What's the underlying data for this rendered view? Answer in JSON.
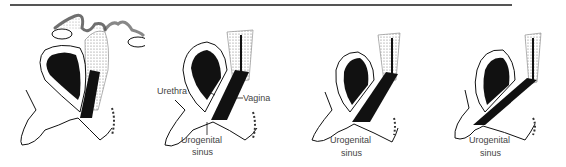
{
  "figure": {
    "panels": [
      {
        "id": "stage-1",
        "labels": {}
      },
      {
        "id": "stage-2",
        "labels": {
          "urethra": "Urethra",
          "vagina": "Vagina",
          "sinus_line1": "Urogenital",
          "sinus_line2": "sinus"
        }
      },
      {
        "id": "stage-3",
        "labels": {
          "sinus_line1": "Urogenital",
          "sinus_line2": "sinus"
        }
      },
      {
        "id": "stage-4",
        "labels": {
          "sinus_line1": "Urogenital",
          "sinus_line2": "sinus"
        }
      }
    ],
    "colors": {
      "ink": "#111111",
      "rule": "#555555",
      "stipple": "#888888",
      "label": "#444444"
    }
  }
}
